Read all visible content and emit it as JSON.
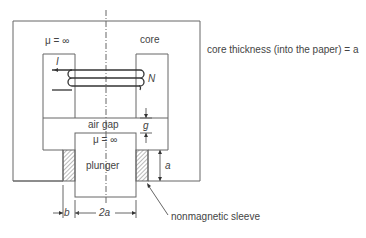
{
  "diagram": {
    "type": "plunger electromagnet cross-section",
    "labels": {
      "mu_core": "μ = ∞",
      "core": "core",
      "current": "I",
      "turns": "N",
      "air_gap": "air gap",
      "gap_dim": "g",
      "mu_plunger": "μ = ∞",
      "plunger": "plunger",
      "sleeve_height": "a",
      "sleeve_width": "b",
      "plunger_width": "2a",
      "sleeve": "nonmagnetic sleeve",
      "thickness_note": "core thickness (into the paper) = a"
    },
    "colors": {
      "line": "#555555",
      "text": "#444444",
      "background": "#ffffff"
    }
  }
}
